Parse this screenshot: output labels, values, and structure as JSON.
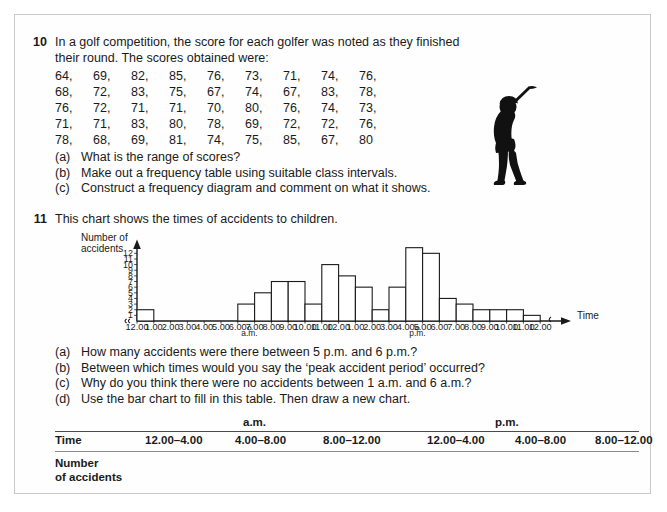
{
  "question10": {
    "number": "10",
    "intro_line1": "In a golf competition, the score for each golfer was noted as they finished",
    "intro_line2": "their round. The scores obtained were:",
    "scores": [
      [
        "64,",
        "69,",
        "82,",
        "85,",
        "76,",
        "73,",
        "71,",
        "74,",
        "76,"
      ],
      [
        "68,",
        "72,",
        "83,",
        "75,",
        "67,",
        "74,",
        "67,",
        "83,",
        "78,"
      ],
      [
        "76,",
        "72,",
        "71,",
        "71,",
        "70,",
        "80,",
        "76,",
        "74,",
        "73,"
      ],
      [
        "71,",
        "71,",
        "83,",
        "80,",
        "78,",
        "69,",
        "72,",
        "72,",
        "76,"
      ],
      [
        "78,",
        "68,",
        "69,",
        "81,",
        "74,",
        "75,",
        "85,",
        "67,",
        "80"
      ]
    ],
    "parts": [
      {
        "label": "(a)",
        "text": "What is the range of scores?"
      },
      {
        "label": "(b)",
        "text": "Make out a frequency table using suitable class intervals."
      },
      {
        "label": "(c)",
        "text": "Construct a frequency diagram and comment on what it shows."
      }
    ],
    "illustration": "golfer-silhouette-icon"
  },
  "question11": {
    "number": "11",
    "intro": "This chart shows the times of accidents to children.",
    "parts": [
      {
        "label": "(a)",
        "text": "How many accidents were there between 5 p.m. and 6 p.m.?"
      },
      {
        "label": "(b)",
        "text": "Between which times would you say the ‘peak accident period’ occurred?"
      },
      {
        "label": "(c)",
        "text": "Why do you think there were no accidents between 1 a.m. and 6 a.m.?"
      },
      {
        "label": "(d)",
        "text": "Use the bar chart to fill in this table. Then draw a new chart."
      }
    ]
  },
  "chart_data": {
    "type": "bar",
    "title": "",
    "ylabel_line1": "Number of",
    "ylabel_line2": "accidents",
    "xlabel": "Time",
    "ylim": [
      0,
      13
    ],
    "yticks": [
      1,
      2,
      3,
      4,
      5,
      6,
      7,
      8,
      9,
      10,
      11,
      12
    ],
    "grid": false,
    "legend": "none",
    "xtick_labels": [
      "12.00",
      "1.00",
      "2.00",
      "3.00",
      "4.00",
      "5.00",
      "6.00",
      "7.00",
      "8.00",
      "9.00",
      "10.00",
      "11.00",
      "12.00",
      "1.00",
      "2.00",
      "3.00",
      "4.00",
      "5.00",
      "6.00",
      "7.00",
      "8.00",
      "9.00",
      "10.00",
      "11.00",
      "12.00"
    ],
    "period_marks": [
      {
        "label": "a.m.",
        "after_tick": "6.00"
      },
      {
        "label": "p.m.",
        "after_tick": "6.00"
      }
    ],
    "categories": [
      "12.00-1.00 a.m.",
      "1.00-2.00 a.m.",
      "2.00-3.00 a.m.",
      "3.00-4.00 a.m.",
      "4.00-5.00 a.m.",
      "5.00-6.00 a.m.",
      "6.00-7.00 a.m.",
      "7.00-8.00 a.m.",
      "8.00-9.00 a.m.",
      "9.00-10.00 a.m.",
      "10.00-11.00 a.m.",
      "11.00-12.00 a.m.",
      "12.00-1.00 p.m.",
      "1.00-2.00 p.m.",
      "2.00-3.00 p.m.",
      "3.00-4.00 p.m.",
      "4.00-5.00 p.m.",
      "5.00-6.00 p.m.",
      "6.00-7.00 p.m.",
      "7.00-8.00 p.m.",
      "8.00-9.00 p.m.",
      "9.00-10.00 p.m.",
      "10.00-11.00 p.m.",
      "11.00-12.00 p.m."
    ],
    "values": [
      2,
      0,
      0,
      0,
      0,
      0,
      3,
      5,
      7,
      7,
      3,
      10,
      8,
      6,
      2,
      6,
      13,
      12,
      4,
      3,
      2,
      2,
      2,
      1
    ]
  },
  "table": {
    "am_label": "a.m.",
    "pm_label": "p.m.",
    "row_label": "Time",
    "columns": [
      "12.00–4.00",
      "4.00–8.00",
      "8.00–12.00",
      "12.00–4.00",
      "4.00–8.00",
      "8.00–12.00"
    ],
    "footer_line1": "Number",
    "footer_line2": "of accidents"
  },
  "colors": {
    "ink": "#1a1a1a",
    "rule": "#4a4a4a",
    "page_border": "#c9c9c9"
  }
}
